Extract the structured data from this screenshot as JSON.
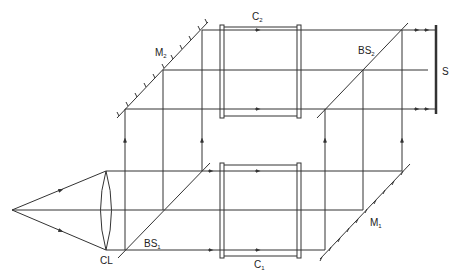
{
  "diagram": {
    "labels": {
      "lens": "CL",
      "beamsplitter_1": "BS",
      "beamsplitter_1_sub": "1",
      "beamsplitter_2": "BS",
      "beamsplitter_2_sub": "2",
      "mirror_1": "M",
      "mirror_1_sub": "1",
      "mirror_2": "M",
      "mirror_2_sub": "2",
      "cell_1": "C",
      "cell_1_sub": "1",
      "cell_2": "C",
      "cell_2_sub": "2",
      "screen": "S"
    },
    "colors": {
      "line": "#333333",
      "background": "#ffffff"
    }
  }
}
